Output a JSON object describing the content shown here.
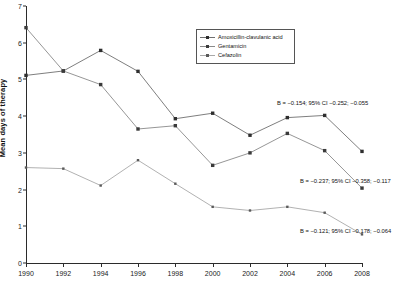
{
  "chart_data": {
    "type": "line",
    "title": "",
    "xlabel": "",
    "ylabel": "Mean days of therapy",
    "x": [
      1990,
      1991,
      1992,
      1993,
      1994,
      1995,
      1996,
      1997,
      1998,
      1999,
      2000,
      2001,
      2002,
      2003,
      2004,
      2005,
      2006,
      2007,
      2008
    ],
    "categories": [
      "1990",
      "1992",
      "1994",
      "1996",
      "1998",
      "2000",
      "2002",
      "2004",
      "2006",
      "2008"
    ],
    "xlim": [
      1990,
      2008
    ],
    "ylim": [
      0,
      7
    ],
    "yticks": [
      0,
      1,
      2,
      3,
      4,
      5,
      6,
      7
    ],
    "xticks": [
      1990,
      1992,
      1994,
      1996,
      1998,
      2000,
      2002,
      2004,
      2006,
      2008
    ],
    "grid": false,
    "legend_position": "upper-right-inside",
    "series": [
      {
        "name": "Amoxicillin-clavulanic acid",
        "marker": "filled-square",
        "color": "#2e2e2e",
        "line_color": "#6f6f6f",
        "x": [
          1990,
          1992,
          1994,
          1996,
          1998,
          2000,
          2002,
          2004,
          2006,
          2008
        ],
        "values": [
          5.11,
          5.23,
          5.79,
          5.22,
          3.93,
          4.08,
          3.48,
          3.96,
          4.02,
          3.04
        ]
      },
      {
        "name": "Gentamicin",
        "marker": "filled-square",
        "color": "#3a3a3a",
        "line_color": "#8a8a8a",
        "x": [
          1990,
          1992,
          1994,
          1996,
          1998,
          2000,
          2002,
          2004,
          2006,
          2008
        ],
        "values": [
          6.41,
          5.23,
          4.86,
          3.65,
          3.74,
          2.66,
          3.0,
          3.53,
          3.06,
          2.04
        ]
      },
      {
        "name": "Cefazolin",
        "marker": "small-square",
        "color": "#5a5a5a",
        "line_color": "#a8a8a8",
        "x": [
          1990,
          1992,
          1994,
          1996,
          1998,
          2000,
          2002,
          2004,
          2006,
          2008
        ],
        "values": [
          2.6,
          2.57,
          2.11,
          2.8,
          2.16,
          1.53,
          1.43,
          1.53,
          1.37,
          0.78
        ]
      }
    ],
    "annotations": [
      {
        "text": "B = −0.154; 95% CI −0.252; −0.055",
        "series": "Amoxicillin-clavulanic acid"
      },
      {
        "text": "B = −0.237; 95% CI −0.358; −0.117",
        "series": "Gentamicin"
      },
      {
        "text": "B = −0.121; 95% CI −0.178; −0.064",
        "series": "Cefazolin"
      }
    ]
  },
  "legend": {
    "items": [
      {
        "label": "Amoxicillin-clavulanic acid"
      },
      {
        "label": "Gentamicin"
      },
      {
        "label": "Cefazolin"
      }
    ]
  },
  "axis": {
    "y_title": "Mean days of therapy",
    "y_labels": [
      "7",
      "6",
      "5",
      "4",
      "3",
      "2",
      "1",
      "0"
    ],
    "x_labels": [
      "1990",
      "1992",
      "1994",
      "1996",
      "1998",
      "2000",
      "2002",
      "2004",
      "2006",
      "2008"
    ]
  }
}
